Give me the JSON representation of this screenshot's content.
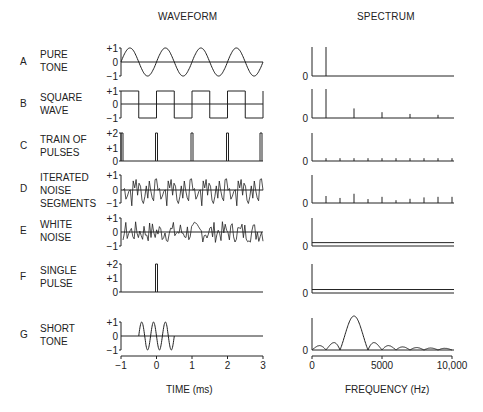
{
  "headers": {
    "waveform": "WAVEFORM",
    "spectrum": "SPECTRUM"
  },
  "rows": [
    {
      "letter": "A",
      "label": "PURE\nTONE",
      "wave_ticks": [
        "+1",
        "0",
        "−1"
      ],
      "spec_zero": "0"
    },
    {
      "letter": "B",
      "label": "SQUARE\nWAVE",
      "wave_ticks": [
        "+1",
        "0",
        "−1"
      ],
      "spec_zero": "0"
    },
    {
      "letter": "C",
      "label": "TRAIN OF\nPULSES",
      "wave_ticks": [
        "+2",
        "+1",
        "0"
      ],
      "spec_zero": "0"
    },
    {
      "letter": "D",
      "label": "ITERATED\nNOISE\nSEGMENTS",
      "wave_ticks": [
        "+1",
        "0",
        "−1"
      ],
      "spec_zero": "0"
    },
    {
      "letter": "E",
      "label": "WHITE\nNOISE",
      "wave_ticks": [
        "+1",
        "0",
        "−1"
      ],
      "spec_zero": "0"
    },
    {
      "letter": "F",
      "label": "SINGLE\nPULSE",
      "wave_ticks": [
        "+2",
        "+1",
        "0"
      ],
      "spec_zero": "0"
    },
    {
      "letter": "G",
      "label": "SHORT\nTONE",
      "wave_ticks": [
        "+1",
        "0",
        "−1"
      ],
      "spec_zero": "0"
    }
  ],
  "axes": {
    "time_label": "TIME (ms)",
    "time_ticks": [
      "−1",
      "0",
      "1",
      "2",
      "3"
    ],
    "freq_label": "FREQUENCY (Hz)",
    "freq_ticks": [
      "0",
      "5000",
      "10,000"
    ]
  },
  "chart_data": [
    {
      "type": "line",
      "title": "WAVEFORM",
      "xlabel": "TIME (ms)",
      "xlim": [
        -1,
        3
      ],
      "xticks": [
        -1,
        0,
        1,
        2,
        3
      ],
      "series": [
        {
          "name": "A PURE TONE",
          "description": "sine, 1 kHz, amplitude 1",
          "ylim": [
            -1,
            1
          ]
        },
        {
          "name": "B SQUARE WAVE",
          "description": "square wave, 1 kHz, amplitude ±1",
          "ylim": [
            -1,
            1
          ]
        },
        {
          "name": "C TRAIN OF PULSES",
          "description": "pulses of height 2 at t = -1, 0, 1, 2, 3 ms",
          "ylim": [
            0,
            2
          ]
        },
        {
          "name": "D ITERATED NOISE SEGMENTS",
          "description": "noise segment repeated every 1 ms",
          "ylim": [
            -1,
            1
          ]
        },
        {
          "name": "E WHITE NOISE",
          "description": "random noise",
          "ylim": [
            -1,
            1
          ]
        },
        {
          "name": "F SINGLE PULSE",
          "description": "single pulse of height 2 at t = 0",
          "ylim": [
            0,
            2
          ]
        },
        {
          "name": "G SHORT TONE",
          "description": "3 cycles of 3 kHz tone from -0.5 to 0.5 ms",
          "ylim": [
            -1,
            1
          ]
        }
      ]
    },
    {
      "type": "bar",
      "title": "SPECTRUM",
      "xlabel": "FREQUENCY (Hz)",
      "xlim": [
        0,
        10000
      ],
      "xticks": [
        0,
        5000,
        10000
      ],
      "series": [
        {
          "name": "A PURE TONE",
          "x": [
            1000
          ],
          "values": [
            1.0
          ]
        },
        {
          "name": "B SQUARE WAVE",
          "x": [
            1000,
            3000,
            5000,
            7000,
            9000
          ],
          "values": [
            1.0,
            0.33,
            0.2,
            0.14,
            0.11
          ]
        },
        {
          "name": "C TRAIN OF PULSES",
          "x": [
            1000,
            2000,
            3000,
            4000,
            5000,
            6000,
            7000,
            8000,
            9000,
            10000
          ],
          "values": [
            0.1,
            0.1,
            0.1,
            0.1,
            0.1,
            0.1,
            0.1,
            0.1,
            0.1,
            0.1
          ]
        },
        {
          "name": "D ITERATED NOISE SEGMENTS",
          "x": [
            1000,
            2000,
            3000,
            4000,
            5000,
            6000,
            7000,
            8000,
            9000,
            10000
          ],
          "values": [
            0.25,
            0.18,
            0.33,
            0.14,
            0.22,
            0.1,
            0.15,
            0.2,
            0.22,
            0.22
          ]
        },
        {
          "name": "E WHITE NOISE",
          "description": "flat continuous spectrum",
          "level": 0.1
        },
        {
          "name": "F SINGLE PULSE",
          "description": "flat continuous spectrum",
          "level": 0.1
        },
        {
          "name": "G SHORT TONE",
          "description": "sinc-shaped spectrum centered at 3000 Hz, nulls every 1000 Hz",
          "peak_x": 3000,
          "peak": 1.25
        }
      ]
    }
  ]
}
